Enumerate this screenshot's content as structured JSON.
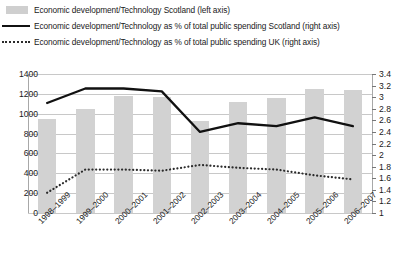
{
  "legend": {
    "items": [
      {
        "key": "bar-swatch",
        "label": "Economic development/Technology Scotland (left axis)"
      },
      {
        "key": "solid-line",
        "label": "Economic development/Technology as % of total public spending Scotland (right axis)"
      },
      {
        "key": "dotted-line",
        "label": "Economic development/Technology as % of total public spending UK (right axis)"
      }
    ]
  },
  "colors": {
    "bar": "#d2d2d2",
    "solid_line": "#111111",
    "dotted_line": "#2b2b2b",
    "gridline": "#c8c8c8",
    "axis": "#a8a8a8",
    "text": "#1a1a1a"
  },
  "chart_data": {
    "type": "bar",
    "title": "",
    "xlabel": "",
    "ylabel": "",
    "grid": true,
    "legend_position": "top",
    "categories": [
      "1998–1999",
      "1999–2000",
      "2000–2001",
      "2001–2002",
      "2002–2003",
      "2003–2004",
      "2004–2005",
      "2005–2006",
      "2006–2007"
    ],
    "left_axis": {
      "label": "",
      "ylim": [
        0,
        1400
      ],
      "ticks": [
        0,
        200,
        400,
        600,
        800,
        1000,
        1200,
        1400
      ],
      "tick_labels": [
        "0",
        "200",
        "400",
        "600",
        "800",
        "1000",
        "1200",
        "1400"
      ]
    },
    "right_axis": {
      "label": "",
      "ylim": [
        1,
        3.4
      ],
      "ticks": [
        1,
        1.2,
        1.4,
        1.6,
        1.8,
        2,
        2.2,
        2.4,
        2.6,
        2.8,
        3,
        3.2,
        3.4
      ],
      "tick_labels": [
        "1",
        "1.2",
        "1.4",
        "1.6",
        "1.8",
        "2",
        "2.2",
        "2.4",
        "2.6",
        "2.8",
        "3",
        "3.2",
        "3.4"
      ]
    },
    "series": [
      {
        "name": "Economic development/Technology Scotland (left axis)",
        "type": "bar",
        "axis": "left",
        "values": [
          950,
          1050,
          1180,
          1170,
          930,
          1120,
          1160,
          1250,
          1240
        ]
      },
      {
        "name": "Economic development/Technology as % of total public spending Scotland (right axis)",
        "type": "line",
        "style": "solid",
        "axis": "right",
        "values": [
          2.9,
          3.15,
          3.15,
          3.1,
          2.4,
          2.55,
          2.5,
          2.65,
          2.5
        ]
      },
      {
        "name": "Economic development/Technology as % of total public spending UK (right axis)",
        "type": "line",
        "style": "dotted",
        "axis": "right",
        "values": [
          1.35,
          1.75,
          1.75,
          1.73,
          1.83,
          1.78,
          1.75,
          1.65,
          1.58
        ]
      }
    ]
  }
}
